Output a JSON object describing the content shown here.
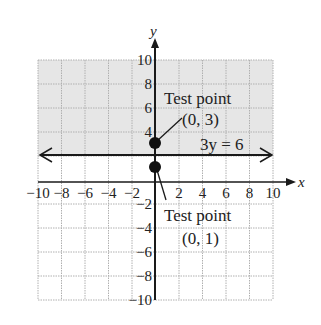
{
  "chart_data": {
    "type": "line",
    "title": "",
    "xlabel": "x",
    "ylabel": "y",
    "xlim": [
      -10,
      10
    ],
    "ylim": [
      -10,
      10
    ],
    "grid": true,
    "x_ticks": [
      -10,
      -8,
      -6,
      -4,
      -2,
      2,
      4,
      6,
      8,
      10
    ],
    "y_ticks": [
      10,
      8,
      6,
      4,
      -2,
      -4,
      -6,
      -8,
      -10
    ],
    "x_tick_labels": [
      "−10",
      "−8",
      "−6",
      "−4",
      "−2",
      "2",
      "4",
      "6",
      "8",
      "10"
    ],
    "y_tick_labels": [
      "10",
      "8",
      "6",
      "4",
      "−2",
      "−4",
      "−6",
      "−8",
      "−10"
    ],
    "boundary_line": {
      "equation": "3y = 6",
      "y": 2,
      "style": "solid",
      "arrows": "both"
    },
    "shaded_region": {
      "description": "y ≥ 2",
      "from_y": 2,
      "to_y": 10,
      "color": "#e6e6e6"
    },
    "points": [
      {
        "label": "Test point",
        "coords": "(0, 3)",
        "x": 0,
        "y": 3
      },
      {
        "label": "Test point",
        "coords": "(0, 1)",
        "x": 0,
        "y": 1
      }
    ],
    "annotations": [
      "Test point (0, 3)",
      "Test point (0, 1)",
      "3y = 6"
    ]
  },
  "labels": {
    "x_axis": "x",
    "y_axis": "y",
    "equation": "3y = 6",
    "upper_point_title": "Test point",
    "upper_point_coords": "(0, 3)",
    "lower_point_title": "Test point",
    "lower_point_coords": "(0, 1)"
  },
  "colors": {
    "shade": "#e6e6e6",
    "grid": "#b0b0b0",
    "axis": "#1a1a1a",
    "point": "#111111"
  }
}
